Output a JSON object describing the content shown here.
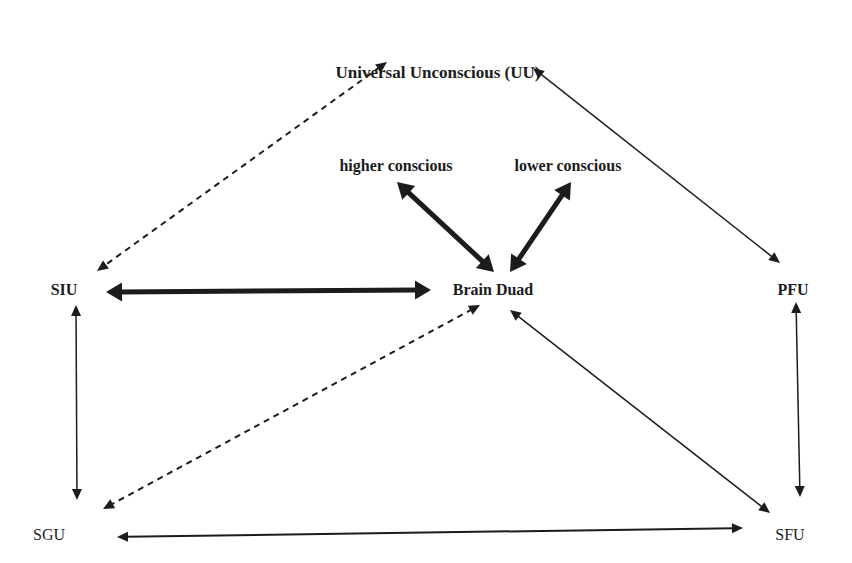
{
  "diagram": {
    "ink_color": "#1c1c1c",
    "nodes": [
      {
        "id": "uu",
        "label": "Universal Unconscious (UU)",
        "x": 438,
        "y": 72,
        "bold": true,
        "size": 17
      },
      {
        "id": "higher",
        "label": "higher conscious",
        "x": 396,
        "y": 166,
        "bold": true,
        "size": 16
      },
      {
        "id": "lower",
        "label": "lower conscious",
        "x": 568,
        "y": 166,
        "bold": true,
        "size": 16
      },
      {
        "id": "siu",
        "label": "SIU",
        "x": 64,
        "y": 290,
        "bold": true,
        "size": 16
      },
      {
        "id": "brain",
        "label": "Brain Duad",
        "x": 493,
        "y": 290,
        "bold": true,
        "size": 16
      },
      {
        "id": "pfu",
        "label": "PFU",
        "x": 793,
        "y": 290,
        "bold": true,
        "size": 16
      },
      {
        "id": "sgu",
        "label": "SGU",
        "x": 49,
        "y": 535,
        "bold": false,
        "size": 16
      },
      {
        "id": "sfu",
        "label": "SFU",
        "x": 790,
        "y": 535,
        "bold": false,
        "size": 16
      }
    ],
    "edges": [
      {
        "id": "uu-siu",
        "from": "uu",
        "to": "siu",
        "style": "dashed",
        "width": 2,
        "x1": 387,
        "y1": 62,
        "x2": 97,
        "y2": 271
      },
      {
        "id": "uu-pfu",
        "from": "uu",
        "to": "pfu",
        "style": "solid",
        "width": 1.5,
        "x1": 533,
        "y1": 68,
        "x2": 780,
        "y2": 263
      },
      {
        "id": "higher-brain",
        "from": "higher",
        "to": "brain",
        "style": "solid",
        "width": 5,
        "x1": 397,
        "y1": 182,
        "x2": 494,
        "y2": 272
      },
      {
        "id": "lower-brain",
        "from": "lower",
        "to": "brain",
        "style": "solid",
        "width": 5,
        "x1": 571,
        "y1": 182,
        "x2": 510,
        "y2": 272
      },
      {
        "id": "siu-brain",
        "from": "siu",
        "to": "brain",
        "style": "solid",
        "width": 5,
        "x1": 106,
        "y1": 292,
        "x2": 431,
        "y2": 290
      },
      {
        "id": "siu-sgu",
        "from": "siu",
        "to": "sgu",
        "style": "solid",
        "width": 1.5,
        "x1": 76,
        "y1": 305,
        "x2": 77,
        "y2": 500
      },
      {
        "id": "brain-sgu",
        "from": "brain",
        "to": "sgu",
        "style": "dashed",
        "width": 2,
        "x1": 480,
        "y1": 305,
        "x2": 103,
        "y2": 509
      },
      {
        "id": "brain-sfu",
        "from": "brain",
        "to": "sfu",
        "style": "solid",
        "width": 1.5,
        "x1": 510,
        "y1": 310,
        "x2": 770,
        "y2": 513
      },
      {
        "id": "pfu-sfu",
        "from": "pfu",
        "to": "sfu",
        "style": "solid",
        "width": 1.5,
        "x1": 796,
        "y1": 302,
        "x2": 800,
        "y2": 497
      },
      {
        "id": "sgu-sfu",
        "from": "sgu",
        "to": "sfu",
        "style": "solid",
        "width": 2,
        "x1": 117,
        "y1": 537,
        "x2": 743,
        "y2": 528
      }
    ]
  }
}
